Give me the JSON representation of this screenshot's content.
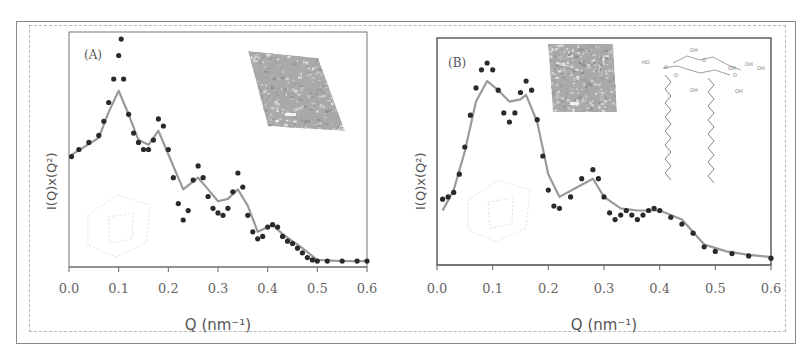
{
  "figure": {
    "panels": [
      {
        "label": "(A)",
        "xlabel": "Q (nm⁻¹)",
        "ylabel": "I(Q)x(Q²)",
        "xticks": [
          "0.0",
          "0.1",
          "0.2",
          "0.3",
          "0.4",
          "0.5",
          "0.6"
        ],
        "insets": [
          "TEM micrograph (rhombic, textured)",
          "faint 3D unit cell sketch"
        ]
      },
      {
        "label": "(B)",
        "xlabel": "Q (nm⁻¹)",
        "ylabel": "I(Q)x(Q²)",
        "xticks": [
          "0.0",
          "0.1",
          "0.2",
          "0.3",
          "0.4",
          "0.5",
          "0.6"
        ],
        "insets": [
          "TEM micrograph (square, textured)",
          "faint 3D unit cell sketch",
          "glycolipid chemical structure with two alkyl chains"
        ],
        "chem_labels": [
          "OH",
          "HO",
          "O",
          "O",
          "OH",
          "O",
          "OH",
          "OH",
          "OH",
          "O",
          "OH"
        ]
      }
    ],
    "colors": {
      "data_points": "#2a2a2a",
      "fit_line": "#9a9a9a",
      "axis": "#666666",
      "frame": "#8a8a8a"
    }
  },
  "chart_data": [
    {
      "type": "scatter",
      "title": "(A)",
      "xlabel": "Q (nm^-1)",
      "ylabel": "I(Q)x(Q^2)",
      "xlim": [
        0.0,
        0.6
      ],
      "ylim": [
        0,
        100
      ],
      "yticks_shown": false,
      "grid": false,
      "legend": null,
      "series": [
        {
          "name": "experimental data",
          "style": "dots",
          "x": [
            0.005,
            0.02,
            0.04,
            0.06,
            0.07,
            0.08,
            0.09,
            0.1,
            0.105,
            0.11,
            0.12,
            0.13,
            0.14,
            0.15,
            0.16,
            0.17,
            0.18,
            0.19,
            0.2,
            0.21,
            0.22,
            0.23,
            0.24,
            0.25,
            0.26,
            0.27,
            0.28,
            0.29,
            0.3,
            0.31,
            0.32,
            0.33,
            0.34,
            0.35,
            0.36,
            0.37,
            0.38,
            0.39,
            0.4,
            0.41,
            0.42,
            0.43,
            0.44,
            0.45,
            0.46,
            0.47,
            0.48,
            0.49,
            0.5,
            0.52,
            0.55,
            0.58,
            0.6
          ],
          "y": [
            47,
            50,
            53,
            56,
            62,
            70,
            80,
            90,
            97,
            80,
            65,
            57,
            53,
            50,
            50,
            54,
            63,
            60,
            50,
            38,
            27,
            20,
            24,
            37,
            43,
            38,
            30,
            25,
            23,
            22,
            25,
            32,
            40,
            34,
            22,
            15,
            12,
            13,
            17,
            18,
            17,
            13,
            11,
            10,
            8,
            6,
            4,
            3,
            2.5,
            2.5,
            2.5,
            2.5,
            2.5
          ]
        },
        {
          "name": "model fit",
          "style": "line",
          "x": [
            0.005,
            0.03,
            0.06,
            0.08,
            0.1,
            0.12,
            0.14,
            0.16,
            0.18,
            0.2,
            0.23,
            0.26,
            0.28,
            0.3,
            0.32,
            0.34,
            0.36,
            0.38,
            0.41,
            0.43,
            0.45,
            0.47,
            0.5,
            0.55,
            0.6
          ],
          "y": [
            47.7,
            51,
            55,
            66,
            75,
            65,
            54,
            52,
            58,
            48,
            33,
            38,
            33,
            28,
            29,
            33,
            26,
            15,
            18,
            14,
            11,
            8,
            3,
            2.5,
            2.5
          ]
        }
      ]
    },
    {
      "type": "scatter",
      "title": "(B)",
      "xlabel": "Q (nm^-1)",
      "ylabel": "I(Q)x(Q^2)",
      "xlim": [
        0.0,
        0.6
      ],
      "ylim": [
        0,
        100
      ],
      "yticks_shown": false,
      "grid": false,
      "legend": null,
      "series": [
        {
          "name": "experimental data",
          "style": "dots",
          "x": [
            0.01,
            0.02,
            0.03,
            0.04,
            0.05,
            0.06,
            0.07,
            0.08,
            0.09,
            0.1,
            0.11,
            0.12,
            0.13,
            0.14,
            0.15,
            0.16,
            0.17,
            0.18,
            0.19,
            0.2,
            0.21,
            0.22,
            0.24,
            0.26,
            0.28,
            0.29,
            0.3,
            0.31,
            0.32,
            0.33,
            0.34,
            0.35,
            0.36,
            0.37,
            0.38,
            0.39,
            0.4,
            0.42,
            0.44,
            0.46,
            0.48,
            0.5,
            0.53,
            0.56,
            0.6
          ],
          "y": [
            29,
            30,
            32,
            40,
            52,
            66,
            78,
            86,
            89,
            86,
            77,
            67,
            63,
            67,
            76,
            81,
            77,
            64,
            48,
            33,
            26,
            25,
            30,
            38,
            42,
            38,
            30,
            23,
            20,
            22,
            24,
            22,
            20,
            22,
            24,
            25,
            24,
            21,
            18,
            14,
            8,
            6,
            5,
            4,
            3
          ]
        },
        {
          "name": "model fit",
          "style": "line",
          "x": [
            0.01,
            0.03,
            0.05,
            0.07,
            0.09,
            0.11,
            0.13,
            0.15,
            0.16,
            0.18,
            0.2,
            0.22,
            0.25,
            0.28,
            0.3,
            0.33,
            0.36,
            0.4,
            0.44,
            0.48,
            0.52,
            0.56,
            0.6
          ],
          "y": [
            24,
            33,
            50,
            72,
            81,
            77,
            72,
            73,
            75,
            63,
            40,
            30,
            34,
            38,
            30,
            25,
            24,
            24,
            20,
            9,
            6,
            4.5,
            3.5
          ]
        }
      ]
    }
  ]
}
